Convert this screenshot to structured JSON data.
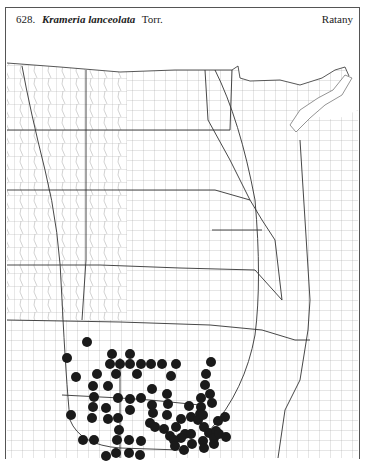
{
  "header": {
    "number": "628.",
    "scientific_name": "Krameria lanceolata",
    "authority": "Torr.",
    "common_name": "Ratany"
  },
  "map": {
    "region": "Great Plains county map",
    "dot_color": "#1a1a1a",
    "line_color": "#555555",
    "dots": [
      [
        87,
        342
      ],
      [
        67,
        358
      ],
      [
        112,
        354
      ],
      [
        130,
        354
      ],
      [
        110,
        364
      ],
      [
        120,
        364
      ],
      [
        130,
        364
      ],
      [
        141,
        364
      ],
      [
        151,
        364
      ],
      [
        162,
        364
      ],
      [
        176,
        364
      ],
      [
        211,
        362
      ],
      [
        76,
        377
      ],
      [
        97,
        374
      ],
      [
        116,
        374
      ],
      [
        137,
        374
      ],
      [
        171,
        376
      ],
      [
        206,
        374
      ],
      [
        93,
        386
      ],
      [
        108,
        386
      ],
      [
        152,
        389
      ],
      [
        205,
        385
      ],
      [
        94,
        397
      ],
      [
        118,
        398
      ],
      [
        130,
        399
      ],
      [
        141,
        398
      ],
      [
        167,
        394
      ],
      [
        210,
        394
      ],
      [
        201,
        398
      ],
      [
        212,
        403
      ],
      [
        93,
        407
      ],
      [
        106,
        408
      ],
      [
        130,
        410
      ],
      [
        152,
        405
      ],
      [
        168,
        404
      ],
      [
        189,
        406
      ],
      [
        201,
        407
      ],
      [
        200,
        414
      ],
      [
        71,
        415
      ],
      [
        92,
        418
      ],
      [
        108,
        419
      ],
      [
        118,
        418
      ],
      [
        153,
        413
      ],
      [
        167,
        415
      ],
      [
        181,
        419
      ],
      [
        191,
        417
      ],
      [
        198,
        420
      ],
      [
        203,
        415
      ],
      [
        225,
        417
      ],
      [
        119,
        430
      ],
      [
        150,
        423
      ],
      [
        155,
        427
      ],
      [
        164,
        429
      ],
      [
        176,
        427
      ],
      [
        185,
        434
      ],
      [
        204,
        427
      ],
      [
        209,
        433
      ],
      [
        216,
        431
      ],
      [
        218,
        421
      ],
      [
        83,
        440
      ],
      [
        94,
        440
      ],
      [
        117,
        440
      ],
      [
        129,
        440
      ],
      [
        141,
        441
      ],
      [
        170,
        436
      ],
      [
        181,
        438
      ],
      [
        191,
        434
      ],
      [
        203,
        441
      ],
      [
        214,
        438
      ],
      [
        219,
        434
      ],
      [
        116,
        453
      ],
      [
        129,
        453
      ],
      [
        140,
        455
      ],
      [
        106,
        456
      ],
      [
        174,
        440
      ],
      [
        175,
        446
      ],
      [
        184,
        450
      ],
      [
        192,
        444
      ],
      [
        204,
        448
      ],
      [
        214,
        444
      ],
      [
        226,
        437
      ]
    ]
  }
}
